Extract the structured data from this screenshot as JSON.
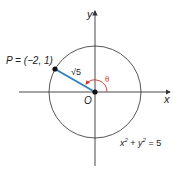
{
  "diagram": {
    "type": "unit-circle-point",
    "circle_equation": "x² + y² = 5",
    "circle_equation_parts": {
      "x": "x",
      "x_exp": "2",
      "plus": " + ",
      "y": "y",
      "y_exp": "2",
      "eq": " = 5"
    },
    "point_label": "P = (−2, 1)",
    "radius_label": "√5",
    "angle_label": "θ",
    "origin_label": "O",
    "x_axis_label": "x",
    "y_axis_label": "y",
    "colors": {
      "radius": "#2f7fc1",
      "angle": "#d0312d",
      "axes": "#333333",
      "circle": "#444444"
    }
  }
}
